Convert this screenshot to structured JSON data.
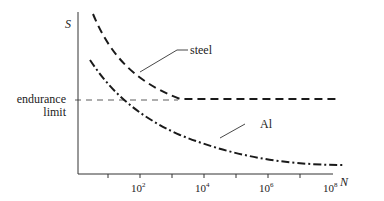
{
  "diagram": {
    "y_axis_label": "S",
    "x_axis_label": "N",
    "x_ticks": [
      {
        "base": "10",
        "exp": "2"
      },
      {
        "base": "10",
        "exp": "4"
      },
      {
        "base": "10",
        "exp": "6"
      },
      {
        "base": "10",
        "exp": "8"
      }
    ],
    "endurance_label_line1": "endurance",
    "endurance_label_line2": "limit",
    "curves": [
      {
        "name": "steel",
        "label": "steel",
        "style": "dashed"
      },
      {
        "name": "aluminum",
        "label": "Al",
        "style": "dash-dot"
      }
    ],
    "colors": {
      "line": "#222222",
      "background": "#ffffff"
    }
  }
}
